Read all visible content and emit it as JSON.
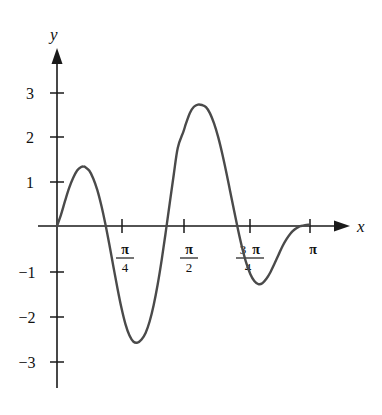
{
  "figure": {
    "background_color": "#ffffff",
    "curve_color": "#4a4a4a",
    "axis_color": "#1a1a1a",
    "text_color": "#111111"
  },
  "axes": {
    "x_axis_label": "x",
    "y_axis_label": "y",
    "x_ticks": [
      {
        "id": "pi-over-4",
        "numerator": "π",
        "denominator": "4",
        "lead": "",
        "value": 0.7853981634
      },
      {
        "id": "pi-over-2",
        "numerator": "π",
        "denominator": "2",
        "lead": "",
        "value": 1.5707963268
      },
      {
        "id": "three-pi-over-4",
        "numerator": "π",
        "denominator": "4",
        "lead": "3",
        "value": 2.3561944902
      },
      {
        "id": "pi",
        "numerator": "π",
        "denominator": "",
        "lead": "",
        "value": 3.1415926536
      }
    ],
    "y_ticks": [
      {
        "label": "3",
        "value": 3
      },
      {
        "label": "2",
        "value": 2
      },
      {
        "label": "1",
        "value": 1
      },
      {
        "label": "−1",
        "value": -1
      },
      {
        "label": "−2",
        "value": -2
      },
      {
        "label": "−3",
        "value": -3
      }
    ]
  },
  "chart_data": {
    "type": "line",
    "title": "",
    "xlabel": "x",
    "ylabel": "y",
    "xlim": [
      0,
      3.3
    ],
    "ylim": [
      -3.4,
      3.6
    ],
    "grid": false,
    "legend": null,
    "annotations": [],
    "series": [
      {
        "name": "curve",
        "color": "#4a4a4a",
        "description": "Oscillating curve on [0, π] with growing-then-shrinking amplitude; zeros at 0, ~0.60, ~π/2, ~2.45 and ~3.03; local max ~1.35 near x≈0.33, local min ~ -2.65 near x≈1.10, local max ~2.75 near x≈1.85, local min ~ -1.30 near x≈2.70",
        "x": [
          0.0,
          0.05,
          0.1,
          0.15,
          0.2,
          0.25,
          0.3,
          0.33,
          0.35,
          0.4,
          0.45,
          0.5,
          0.55,
          0.6,
          0.65,
          0.7,
          0.75,
          0.8,
          0.85,
          0.9,
          0.95,
          1.0,
          1.05,
          1.1,
          1.15,
          1.2,
          1.25,
          1.3,
          1.35,
          1.4,
          1.45,
          1.5,
          1.5708,
          1.6,
          1.65,
          1.7,
          1.75,
          1.8,
          1.85,
          1.9,
          1.95,
          2.0,
          2.05,
          2.1,
          2.15,
          2.2,
          2.25,
          2.3,
          2.35,
          2.4,
          2.45,
          2.5,
          2.55,
          2.6,
          2.65,
          2.7,
          2.75,
          2.8,
          2.85,
          2.9,
          2.95,
          3.0,
          3.03,
          3.08,
          3.13
        ],
        "y": [
          0.0,
          0.26,
          0.57,
          0.86,
          1.09,
          1.26,
          1.34,
          1.35,
          1.34,
          1.26,
          1.08,
          0.82,
          0.47,
          0.05,
          -0.42,
          -0.92,
          -1.41,
          -1.86,
          -2.23,
          -2.49,
          -2.63,
          -2.65,
          -2.58,
          -2.43,
          -2.17,
          -1.8,
          -1.33,
          -0.77,
          -0.14,
          0.52,
          1.17,
          1.78,
          2.15,
          2.32,
          2.57,
          2.71,
          2.76,
          2.75,
          2.7,
          2.56,
          2.33,
          2.03,
          1.66,
          1.24,
          0.79,
          0.34,
          -0.1,
          -0.5,
          -0.84,
          -1.09,
          -1.25,
          -1.32,
          -1.3,
          -1.2,
          -1.05,
          -0.86,
          -0.66,
          -0.46,
          -0.3,
          -0.17,
          -0.08,
          -0.02,
          0.0,
          0.02,
          0.03
        ]
      }
    ]
  }
}
